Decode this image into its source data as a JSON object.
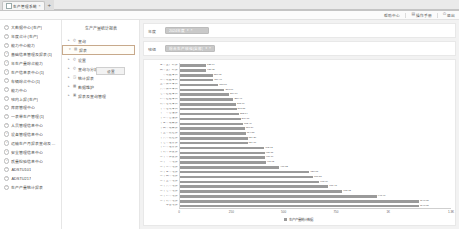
{
  "browser": {
    "tab_title": "生产管理系统",
    "tab_close_icon": "×",
    "new_tab_icon": "+",
    "favicon_icon": "page-icon"
  },
  "topbar": {
    "items": [
      {
        "label": "帮助中心",
        "icon": ""
      },
      {
        "label": "操作手册",
        "icon": "book-icon"
      },
      {
        "label": "退出",
        "icon": "power-icon"
      }
    ]
  },
  "sidebar": {
    "items": [
      {
        "label": "大数据中心(生产)",
        "icon": "circle-plus-icon"
      },
      {
        "label": "年度合计(生产)",
        "icon": "circle-plus-icon"
      },
      {
        "label": "能力中心能力",
        "icon": "circle-plus-icon"
      },
      {
        "label": "基础信息管理及报表(1)",
        "icon": "circle-plus-icon"
      },
      {
        "label": "年生产量综合能力",
        "icon": "circle-plus-icon"
      },
      {
        "label": "生产信息表中心(1)",
        "icon": "circle-plus-icon"
      },
      {
        "label": "车辆综合中心(1)",
        "icon": "circle-plus-icon"
      },
      {
        "label": "能力中心",
        "icon": "circle-plus-icon"
      },
      {
        "label": "班内上报(生产)",
        "icon": "circle-plus-icon"
      },
      {
        "label": "库房管理中心",
        "icon": "circle-plus-icon"
      },
      {
        "label": "一表单生产管理(1)",
        "icon": "circle-plus-icon"
      },
      {
        "label": "人员管理信息中心",
        "icon": "circle-plus-icon"
      },
      {
        "label": "设备管理信息中心",
        "icon": "circle-plus-icon"
      },
      {
        "label": "运输生产月报表查询及管理",
        "icon": "circle-plus-icon"
      },
      {
        "label": "安全管理信息中心",
        "icon": "circle-plus-icon"
      },
      {
        "label": "质量检验信息中心",
        "icon": "circle-plus-icon"
      },
      {
        "label": "ADSTU101",
        "icon": "circle-plus-icon"
      },
      {
        "label": "ADSTU217",
        "icon": "circle-plus-icon"
      },
      {
        "label": "生产产量统计报表",
        "icon": "circle-plus-icon"
      }
    ]
  },
  "tree": {
    "title": "生产产量统计报表",
    "nodes": [
      {
        "label": "查询",
        "icon": "clock-icon",
        "arrow": "▸",
        "selected": false
      },
      {
        "label": "报表",
        "icon": "doc-icon",
        "arrow": "▾",
        "selected": true
      },
      {
        "label": "设置",
        "icon": "clock-icon",
        "arrow": "▸",
        "selected": false
      },
      {
        "label": "查询与分析",
        "icon": "clock-icon",
        "arrow": "▸",
        "selected": false
      },
      {
        "label": "统计报表",
        "icon": "chart-icon",
        "arrow": "▸",
        "selected": false
      },
      {
        "label": "数据维护",
        "icon": "table-icon",
        "arrow": "▸",
        "selected": false
      },
      {
        "label": "报表及查询管理",
        "icon": "grid-icon",
        "arrow": "▸",
        "selected": false
      }
    ],
    "tooltip_button": "设置"
  },
  "filters": [
    {
      "label": "年度",
      "value": "2024年度",
      "caret": "▾",
      "clear": "×"
    },
    {
      "label": "班组",
      "value": "综合生产班组(全部)",
      "caret": "▾",
      "clear": "×"
    }
  ],
  "chart_data": {
    "type": "bar",
    "orientation": "horizontal",
    "title": "",
    "xlabel": "",
    "ylabel": "",
    "xlim": [
      0,
      1300
    ],
    "xticks": [
      "0",
      "250",
      "500",
      "750",
      "1K",
      "1.3K"
    ],
    "xtick_values": [
      0,
      250,
      500,
      750,
      1000,
      1300
    ],
    "grid": false,
    "legend_position": "bottom",
    "legend": [
      "生产产量统计数据"
    ],
    "series_name": "生产产量统计数据",
    "bar_color": "#9a9a9a",
    "categories": [
      "三号生产线组",
      "四号生产线组",
      "一号装配车间",
      "二号装配车间",
      "五号加工车间",
      "六号加工车间",
      "七号检验车间",
      "八号检验车间",
      "九号包装车间",
      "十号包装车间",
      "十一号仓储组",
      "十二号仓储组",
      "十三号运输组",
      "十四号运输组",
      "十五号质检组",
      "十六号质检组",
      "十七号维修组",
      "十八号维修组",
      "十九号调度组",
      "二十号调度组",
      "二十一号班组",
      "二十二号班组",
      "二十三号班组",
      "二十四号班组",
      "二十五号班组",
      "二十六号班组",
      "二十七号班组",
      "二十八号班组",
      "二十九号班组",
      "综合班组"
    ],
    "values": [
      125.04,
      126.29,
      156.72,
      159.4,
      183.06,
      213.06,
      234.79,
      256.47,
      268.69,
      271.58,
      282.74,
      290.73,
      302.46,
      310.39,
      314.85,
      324.26,
      324.06,
      402.92,
      405.75,
      406.79,
      411.62,
      476.52,
      620.75,
      637.88,
      668.09,
      711.45,
      778.72,
      943.97,
      1146.05,
      1146.05
    ],
    "value_labels": [
      "125.04",
      "126.29",
      "156.72",
      "159.40",
      "183.06",
      "213.06",
      "234.79",
      "256.47",
      "268.69",
      "271.58",
      "282.74",
      "290.73",
      "302.46",
      "310.39",
      "314.85",
      "324.26",
      "324.06",
      "402.92",
      "405.75",
      "406.79",
      "411.62",
      "476.52",
      "620.75",
      "637.88",
      "668.09",
      "711.45",
      "778.72",
      "943.97",
      "1146.05",
      "1146.05"
    ]
  }
}
